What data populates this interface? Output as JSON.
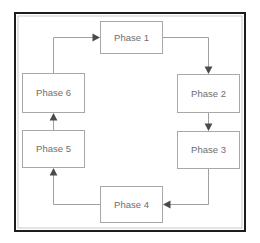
{
  "diagram": {
    "type": "cycle",
    "direction": "clockwise",
    "colors": {
      "frame": "#1c1c1c",
      "frame_inner": "#c9c9c9",
      "box_border": "#a8a8a8",
      "box_fill": "#ffffff",
      "connector": "#a0a0a0",
      "arrow": "#4a4a4a",
      "label_text": "#6e6e6e",
      "background": "#ffffff"
    },
    "nodes": [
      {
        "id": "phase-1",
        "label": "Phase 1",
        "x": 100,
        "y": 21,
        "w": 63,
        "h": 33,
        "cx": 131.5,
        "cy": 37.5
      },
      {
        "id": "phase-2",
        "label": "Phase 2",
        "x": 177,
        "y": 74,
        "w": 63,
        "h": 39,
        "cx": 208.5,
        "cy": 93.5
      },
      {
        "id": "phase-3",
        "label": "Phase 3",
        "x": 177,
        "y": 131,
        "w": 63,
        "h": 38,
        "cx": 208.5,
        "cy": 150
      },
      {
        "id": "phase-4",
        "label": "Phase 4",
        "x": 100,
        "y": 186,
        "w": 63,
        "h": 37,
        "cx": 131.5,
        "cy": 204.5
      },
      {
        "id": "phase-5",
        "label": "Phase 5",
        "x": 22,
        "y": 130,
        "w": 63,
        "h": 38,
        "cx": 53.5,
        "cy": 149
      },
      {
        "id": "phase-6",
        "label": "Phase 6",
        "x": 22,
        "y": 73,
        "w": 63,
        "h": 40,
        "cx": 53.5,
        "cy": 93
      }
    ],
    "edges": [
      {
        "id": "edge-p1-p2",
        "from": "phase-1",
        "to": "phase-2",
        "path": "M163,37.5 L208.5,37.5 L208.5,68",
        "arrow_at": {
          "x": 208.5,
          "y": 73,
          "dir": "down"
        }
      },
      {
        "id": "edge-p2-p3",
        "from": "phase-2",
        "to": "phase-3",
        "path": "M208.5,113 L208.5,125",
        "arrow_at": {
          "x": 208.5,
          "y": 130,
          "dir": "down"
        }
      },
      {
        "id": "edge-p3-p4",
        "from": "phase-3",
        "to": "phase-4",
        "path": "M208.5,169 L208.5,204.5 L169,204.5",
        "arrow_at": {
          "x": 164,
          "y": 204.5,
          "dir": "left"
        }
      },
      {
        "id": "edge-p4-p5",
        "from": "phase-4",
        "to": "phase-5",
        "path": "M100,204.5 L53.5,204.5 L53.5,174",
        "arrow_at": {
          "x": 53.5,
          "y": 169,
          "dir": "up"
        }
      },
      {
        "id": "edge-p5-p6",
        "from": "phase-5",
        "to": "phase-6",
        "path": "M53.5,130 L53.5,119",
        "arrow_at": {
          "x": 53.5,
          "y": 114,
          "dir": "up"
        }
      },
      {
        "id": "edge-p6-p1",
        "from": "phase-6",
        "to": "phase-1",
        "path": "M53.5,73 L53.5,37.5 L95,37.5",
        "arrow_at": {
          "x": 100,
          "y": 37.5,
          "dir": "right"
        }
      }
    ],
    "frame": {
      "x": 14,
      "y": 12,
      "w": 232,
      "h": 220
    }
  }
}
